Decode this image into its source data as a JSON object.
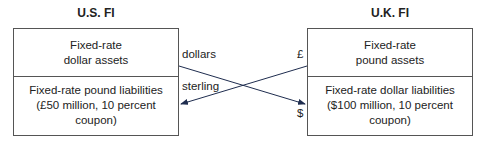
{
  "us_fi": {
    "title": "U.S. FI",
    "assets": {
      "line1": "Fixed-rate",
      "line2": "dollar assets"
    },
    "liabilities": {
      "line1": "Fixed-rate pound liabilities",
      "line2": "(£50 million, 10 percent coupon)"
    }
  },
  "uk_fi": {
    "title": "U.K. FI",
    "assets": {
      "line1": "Fixed-rate",
      "line2": "pound assets"
    },
    "liabilities": {
      "line1": "Fixed-rate dollar liabilities",
      "line2": "($100 million, 10 percent coupon)"
    }
  },
  "flows": {
    "dollars_label": "dollars",
    "sterling_label": "sterling",
    "pound_symbol": "£",
    "dollar_symbol": "$"
  },
  "colors": {
    "arrow": "#1f2d4f",
    "border": "#555555"
  }
}
